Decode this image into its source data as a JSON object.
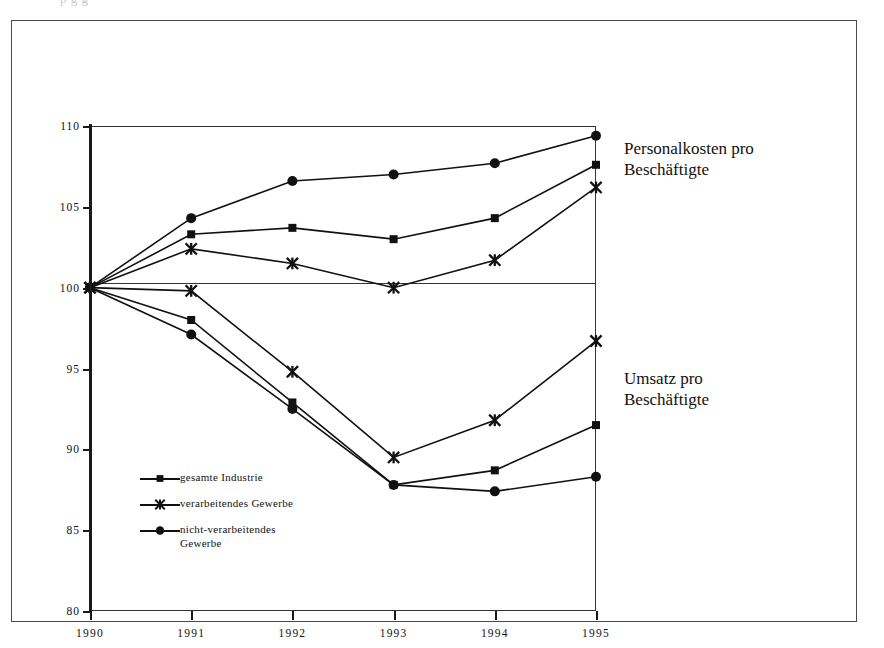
{
  "figure": {
    "background": "#ffffff",
    "ink_color": "#111111",
    "top_sliver_ghost_text": "p g        g"
  },
  "annotations": [
    {
      "id": "personalkosten",
      "text": "Personalkosten pro\nBeschäftigte"
    },
    {
      "id": "umsatz",
      "text": "Umsatz pro\nBeschäftigte"
    }
  ],
  "legend": {
    "items": [
      {
        "label": "gesamte Industrie",
        "marker": "square-marker"
      },
      {
        "label": "verarbeitendes Gewerbe",
        "marker": "cross-star-marker"
      },
      {
        "label": "nicht-verarbeitendes\nGewerbe",
        "marker": "circle-marker"
      }
    ]
  },
  "chart_data": {
    "type": "line",
    "title": "",
    "xlabel": "",
    "ylabel": "",
    "x": [
      1990,
      1991,
      1992,
      1993,
      1994,
      1995
    ],
    "xtick_labels": [
      "1990",
      "1991",
      "1992",
      "1993",
      "1994",
      "1995"
    ],
    "ytick_labels": [
      "80",
      "85",
      "90",
      "95",
      "100",
      "105",
      "110"
    ],
    "yticks": [
      80,
      85,
      90,
      95,
      100,
      105,
      110
    ],
    "ylim": [
      80,
      110
    ],
    "xlim": [
      1990,
      1995
    ],
    "grid": false,
    "reference_line": 100,
    "legend_position": "inside-lower-left",
    "groups": [
      {
        "name": "Personalkosten pro Beschäftigte",
        "series": [
          {
            "name": "nicht-verarbeitendes Gewerbe",
            "marker": "circle-marker",
            "values": [
              100.0,
              104.3,
              106.6,
              107.0,
              107.7,
              109.4
            ]
          },
          {
            "name": "gesamte Industrie",
            "marker": "square-marker",
            "values": [
              100.0,
              103.3,
              103.7,
              103.0,
              104.3,
              107.6
            ]
          },
          {
            "name": "verarbeitendes Gewerbe",
            "marker": "cross-star-marker",
            "values": [
              100.0,
              102.4,
              101.5,
              100.0,
              101.7,
              106.2
            ]
          }
        ]
      },
      {
        "name": "Umsatz pro Beschäftigte",
        "series": [
          {
            "name": "verarbeitendes Gewerbe",
            "marker": "cross-star-marker",
            "values": [
              100.0,
              99.8,
              94.8,
              89.5,
              91.8,
              96.7
            ]
          },
          {
            "name": "gesamte Industrie",
            "marker": "square-marker",
            "values": [
              100.0,
              98.0,
              92.9,
              87.8,
              88.7,
              91.5
            ]
          },
          {
            "name": "nicht-verarbeitendes Gewerbe",
            "marker": "circle-marker",
            "values": [
              100.0,
              97.1,
              92.5,
              87.8,
              87.4,
              88.3
            ]
          }
        ]
      }
    ]
  }
}
